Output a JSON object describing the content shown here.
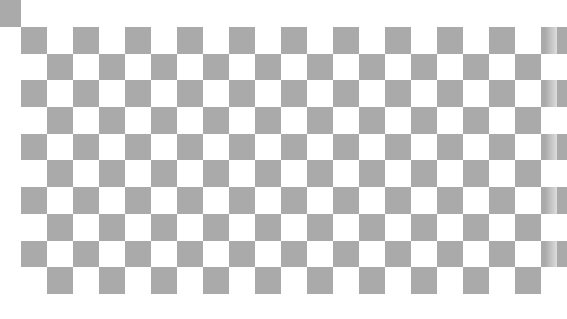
{
  "pattern": {
    "type": "checkerboard",
    "rows": 10,
    "columns": 21,
    "cell_width_px": 26,
    "cell_height_px": 26.7,
    "origin": {
      "x": 21,
      "y": 27
    },
    "first_cell_filled": true
  },
  "corner_square": {
    "x": 0,
    "y": 0,
    "width": 21,
    "height": 27
  },
  "colors": {
    "dark": "#aaaaaa",
    "light": "#ffffff",
    "background": "#ffffff"
  }
}
